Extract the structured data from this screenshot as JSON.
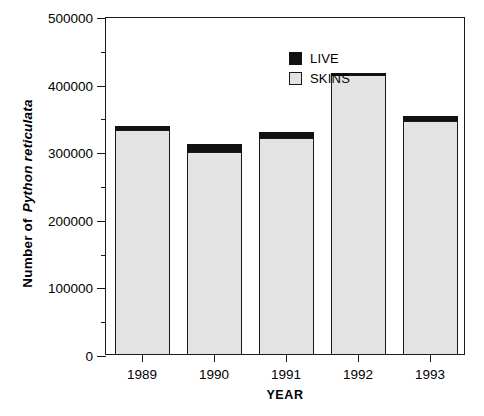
{
  "chart_data": {
    "type": "bar",
    "subtype": "stacked-bar",
    "title": "",
    "xlabel": "YEAR",
    "ylabel_prefix": "Number of",
    "ylabel_species": "Python reticulata",
    "ylabel": "Number of Python reticulata",
    "categories": [
      "1989",
      "1990",
      "1991",
      "1992",
      "1993"
    ],
    "ylim": [
      0,
      500000
    ],
    "ytick_labels": [
      "0",
      "100000",
      "200000",
      "300000",
      "400000",
      "500000"
    ],
    "ytick_values": [
      0,
      100000,
      200000,
      300000,
      400000,
      500000
    ],
    "yminor_values": [
      50000,
      150000,
      250000,
      350000,
      450000
    ],
    "grid": false,
    "legend_position": "upper-center",
    "series": [
      {
        "name": "SKINS",
        "color": "#e3e3e3",
        "values": [
          331000,
          299000,
          320000,
          414000,
          345000
        ]
      },
      {
        "name": "LIVE",
        "color": "#111111",
        "values": [
          6000,
          12000,
          9000,
          2000,
          7000
        ]
      }
    ],
    "totals": [
      337000,
      311000,
      329000,
      416000,
      352000
    ]
  },
  "legend": {
    "items": [
      {
        "label": "LIVE",
        "swatch": "live"
      },
      {
        "label": "SKINS",
        "swatch": "skins"
      }
    ]
  },
  "colors": {
    "skins": "#e3e3e3",
    "live": "#111111",
    "axis": "#1a1a1a",
    "background": "#ffffff"
  }
}
